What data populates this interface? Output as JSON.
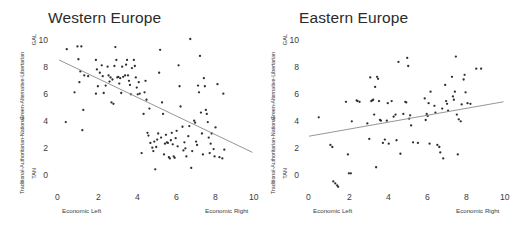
{
  "figure": {
    "panels": [
      {
        "id": "western-europe",
        "title": "Western Europe",
        "yaxis": {
          "caption_top": "Green-Alternative-Libertarian",
          "caption_bottom": "Traditional-Authoritarian-National",
          "pole_top": "GAL",
          "pole_bottom": "TAN",
          "ticks": [
            "0",
            "2",
            "4",
            "6",
            "8",
            "10"
          ]
        },
        "xaxis": {
          "ticks": [
            "0",
            "2",
            "4",
            "6",
            "8",
            "10"
          ],
          "label_left": "Economic Left",
          "label_right": "Economic Right"
        }
      },
      {
        "id": "eastern-europe",
        "title": "Eastern Europe",
        "yaxis": {
          "caption_top": "Green-Alternative-Libertarian",
          "caption_bottom": "Traditional-Authoritarian-National",
          "pole_top": "GAL",
          "pole_bottom": "TAN",
          "ticks": [
            "0",
            "2",
            "4",
            "6",
            "8",
            "10"
          ]
        },
        "xaxis": {
          "ticks": [
            "0",
            "2",
            "4",
            "6",
            "8",
            "10"
          ],
          "label_left": "Economic Left",
          "label_right": "Economic Right"
        }
      }
    ],
    "colors": {
      "point": "#2f2f2f",
      "line": "#8a8a8a",
      "text": "#2b2b2b",
      "background": "#ffffff"
    }
  },
  "chart_data": [
    {
      "type": "scatter",
      "title": "Western Europe",
      "xlabel": "Economic Left – Economic Right",
      "ylabel": "Traditional-Authoritarian-National – Green-Alternative-Libertarian",
      "xlim": [
        0,
        10
      ],
      "ylim": [
        0,
        10
      ],
      "xticks": [
        0,
        2,
        4,
        6,
        8,
        10
      ],
      "yticks": [
        0,
        2,
        4,
        6,
        8,
        10
      ],
      "grid": false,
      "legend": "none",
      "trendline": {
        "x": [
          0.05,
          10.0
        ],
        "y": [
          8.45,
          1.6
        ],
        "slope": -0.69,
        "intercept": 8.45
      },
      "points": [
        [
          0.45,
          9.25
        ],
        [
          0.4,
          3.85
        ],
        [
          1.0,
          9.45
        ],
        [
          1.2,
          9.45
        ],
        [
          1.05,
          8.5
        ],
        [
          1.15,
          7.6
        ],
        [
          1.1,
          6.8
        ],
        [
          1.35,
          7.3
        ],
        [
          1.3,
          4.75
        ],
        [
          1.25,
          3.25
        ],
        [
          0.85,
          6.05
        ],
        [
          1.55,
          7.25
        ],
        [
          1.95,
          8.45
        ],
        [
          2.0,
          7.75
        ],
        [
          2.15,
          7.5
        ],
        [
          2.25,
          8.05
        ],
        [
          2.3,
          7.25
        ],
        [
          2.05,
          6.5
        ],
        [
          1.95,
          5.95
        ],
        [
          2.35,
          6.0
        ],
        [
          2.55,
          7.95
        ],
        [
          2.6,
          7.3
        ],
        [
          2.65,
          6.85
        ],
        [
          2.7,
          7.15
        ],
        [
          2.8,
          7.0
        ],
        [
          2.75,
          5.3
        ],
        [
          2.85,
          5.2
        ],
        [
          2.95,
          9.4
        ],
        [
          3.0,
          8.45
        ],
        [
          3.05,
          7.15
        ],
        [
          3.1,
          7.2
        ],
        [
          3.2,
          7.1
        ],
        [
          3.15,
          6.7
        ],
        [
          3.25,
          6.0
        ],
        [
          3.3,
          7.95
        ],
        [
          3.45,
          7.3
        ],
        [
          3.5,
          8.1
        ],
        [
          3.55,
          8.45
        ],
        [
          3.6,
          7.3
        ],
        [
          3.65,
          6.9
        ],
        [
          3.7,
          6.6
        ],
        [
          3.8,
          7.85
        ],
        [
          3.9,
          8.45
        ],
        [
          3.95,
          8.0
        ],
        [
          4.0,
          7.15
        ],
        [
          4.05,
          6.4
        ],
        [
          4.1,
          5.9
        ],
        [
          4.15,
          6.8
        ],
        [
          4.2,
          5.95
        ],
        [
          4.3,
          1.55
        ],
        [
          4.4,
          4.45
        ],
        [
          4.5,
          6.9
        ],
        [
          4.55,
          5.5
        ],
        [
          4.6,
          3.05
        ],
        [
          4.65,
          2.85
        ],
        [
          4.7,
          4.85
        ],
        [
          4.75,
          2.3
        ],
        [
          4.85,
          1.95
        ],
        [
          4.9,
          1.7
        ],
        [
          4.95,
          2.4
        ],
        [
          5.0,
          0.35
        ],
        [
          5.05,
          2.0
        ],
        [
          5.1,
          2.55
        ],
        [
          5.15,
          3.0
        ],
        [
          5.2,
          7.5
        ],
        [
          5.25,
          9.2
        ],
        [
          5.35,
          5.3
        ],
        [
          5.4,
          4.45
        ],
        [
          5.45,
          1.45
        ],
        [
          5.5,
          2.25
        ],
        [
          5.55,
          2.9
        ],
        [
          5.6,
          2.35
        ],
        [
          5.65,
          2.3
        ],
        [
          5.7,
          1.25
        ],
        [
          5.75,
          1.15
        ],
        [
          5.8,
          2.5
        ],
        [
          5.85,
          3.05
        ],
        [
          5.9,
          2.2
        ],
        [
          5.95,
          1.3
        ],
        [
          6.0,
          1.2
        ],
        [
          6.05,
          2.65
        ],
        [
          6.1,
          3.2
        ],
        [
          6.15,
          2.05
        ],
        [
          6.2,
          8.05
        ],
        [
          6.25,
          6.5
        ],
        [
          6.3,
          5.0
        ],
        [
          6.4,
          3.5
        ],
        [
          6.5,
          2.35
        ],
        [
          6.55,
          1.9
        ],
        [
          6.6,
          1.3
        ],
        [
          6.7,
          2.8
        ],
        [
          6.75,
          3.55
        ],
        [
          6.8,
          10.0
        ],
        [
          6.85,
          0.45
        ],
        [
          6.9,
          1.7
        ],
        [
          7.0,
          3.95
        ],
        [
          7.05,
          3.8
        ],
        [
          7.1,
          2.4
        ],
        [
          7.15,
          2.15
        ],
        [
          7.2,
          6.55
        ],
        [
          7.25,
          6.05
        ],
        [
          7.3,
          8.75
        ],
        [
          7.35,
          4.55
        ],
        [
          7.4,
          3.0
        ],
        [
          7.45,
          1.45
        ],
        [
          7.5,
          7.1
        ],
        [
          7.55,
          6.5
        ],
        [
          7.6,
          4.75
        ],
        [
          7.65,
          4.45
        ],
        [
          7.7,
          3.85
        ],
        [
          7.75,
          2.7
        ],
        [
          7.8,
          1.55
        ],
        [
          7.9,
          3.0
        ],
        [
          8.0,
          1.85
        ],
        [
          8.05,
          1.3
        ],
        [
          8.1,
          3.45
        ],
        [
          8.2,
          6.65
        ],
        [
          8.3,
          1.25
        ],
        [
          8.45,
          1.15
        ],
        [
          8.5,
          5.95
        ],
        [
          8.55,
          1.8
        ],
        [
          2.45,
          6.55
        ],
        [
          3.35,
          7.2
        ],
        [
          4.45,
          6.05
        ],
        [
          5.3,
          2.7
        ],
        [
          6.45,
          1.75
        ],
        [
          7.85,
          2.25
        ],
        [
          3.75,
          5.9
        ],
        [
          2.9,
          8.0
        ]
      ]
    },
    {
      "type": "scatter",
      "title": "Eastern Europe",
      "xlabel": "Economic Left – Economic Right",
      "ylabel": "Traditional-Authoritarian-National – Green-Alternative-Libertarian",
      "xlim": [
        0,
        10
      ],
      "ylim": [
        0,
        10
      ],
      "xticks": [
        0,
        2,
        4,
        6,
        8,
        10
      ],
      "yticks": [
        0,
        2,
        4,
        6,
        8,
        10
      ],
      "grid": false,
      "legend": "none",
      "trendline": {
        "x": [
          0.0,
          10.0
        ],
        "y": [
          2.8,
          5.35
        ],
        "slope": 0.255,
        "intercept": 2.8
      },
      "points": [
        [
          0.5,
          4.2
        ],
        [
          1.1,
          2.15
        ],
        [
          1.2,
          2.0
        ],
        [
          1.25,
          -0.55
        ],
        [
          1.35,
          -0.7
        ],
        [
          1.45,
          -0.85
        ],
        [
          1.5,
          -0.95
        ],
        [
          1.9,
          5.35
        ],
        [
          2.0,
          1.45
        ],
        [
          2.05,
          0.05
        ],
        [
          2.15,
          0.05
        ],
        [
          2.2,
          3.9
        ],
        [
          2.45,
          5.45
        ],
        [
          2.6,
          5.35
        ],
        [
          3.0,
          3.75
        ],
        [
          3.1,
          2.6
        ],
        [
          3.15,
          7.15
        ],
        [
          3.25,
          5.45
        ],
        [
          3.3,
          5.5
        ],
        [
          3.35,
          4.4
        ],
        [
          3.4,
          6.45
        ],
        [
          3.45,
          0.5
        ],
        [
          3.5,
          7.2
        ],
        [
          3.55,
          7.05
        ],
        [
          3.6,
          5.4
        ],
        [
          3.65,
          4.0
        ],
        [
          3.7,
          3.95
        ],
        [
          3.8,
          2.3
        ],
        [
          3.9,
          2.55
        ],
        [
          4.0,
          3.95
        ],
        [
          4.05,
          5.25
        ],
        [
          4.1,
          2.25
        ],
        [
          4.25,
          5.4
        ],
        [
          4.35,
          4.25
        ],
        [
          4.5,
          2.5
        ],
        [
          4.6,
          8.3
        ],
        [
          4.7,
          1.5
        ],
        [
          4.85,
          4.45
        ],
        [
          4.95,
          5.35
        ],
        [
          5.0,
          5.3
        ],
        [
          5.05,
          8.6
        ],
        [
          5.1,
          8.0
        ],
        [
          5.15,
          4.1
        ],
        [
          5.2,
          4.35
        ],
        [
          5.25,
          3.6
        ],
        [
          5.35,
          2.35
        ],
        [
          5.95,
          5.6
        ],
        [
          6.0,
          4.0
        ],
        [
          6.05,
          4.45
        ],
        [
          6.1,
          4.3
        ],
        [
          6.15,
          5.25
        ],
        [
          6.2,
          2.25
        ],
        [
          6.25,
          6.1
        ],
        [
          6.5,
          4.55
        ],
        [
          6.6,
          2.15
        ],
        [
          6.7,
          2.0
        ],
        [
          6.75,
          1.6
        ],
        [
          6.85,
          4.85
        ],
        [
          6.9,
          1.15
        ],
        [
          7.0,
          6.6
        ],
        [
          7.05,
          5.4
        ],
        [
          7.1,
          5.2
        ],
        [
          7.15,
          4.7
        ],
        [
          7.35,
          7.2
        ],
        [
          7.4,
          5.75
        ],
        [
          7.45,
          5.5
        ],
        [
          7.5,
          6.1
        ],
        [
          7.55,
          8.7
        ],
        [
          7.6,
          4.4
        ],
        [
          7.65,
          1.45
        ],
        [
          7.7,
          4.05
        ],
        [
          7.8,
          3.9
        ],
        [
          7.85,
          5.15
        ],
        [
          7.95,
          7.0
        ],
        [
          8.0,
          7.35
        ],
        [
          8.05,
          6.05
        ],
        [
          8.15,
          5.25
        ],
        [
          8.3,
          5.2
        ],
        [
          8.6,
          7.8
        ],
        [
          8.85,
          7.8
        ],
        [
          6.45,
          5.05
        ],
        [
          5.6,
          2.3
        ],
        [
          4.45,
          4.4
        ],
        [
          3.2,
          5.4
        ],
        [
          2.5,
          5.4
        ]
      ]
    }
  ]
}
